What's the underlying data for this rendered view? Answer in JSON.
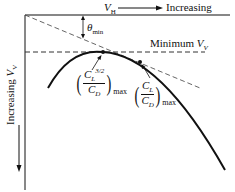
{
  "diagram": {
    "top_axis": {
      "label_var": "V",
      "label_sub": "H",
      "label_text": "Increasing"
    },
    "left_axis": {
      "label_text": "Increasing",
      "label_var": "V",
      "label_sub": "V"
    },
    "angle_label": {
      "symbol": "θ",
      "sub": "min"
    },
    "min_line_label": {
      "text": "Minimum",
      "var": "V",
      "sub": "V"
    },
    "point1": {
      "num": "C",
      "num_sub": "L",
      "num_sup": "3/2",
      "den": "C",
      "den_sub": "D",
      "suffix": "max"
    },
    "point2": {
      "num": "C",
      "num_sub": "L",
      "den": "C",
      "den_sub": "D",
      "suffix": "max"
    }
  }
}
